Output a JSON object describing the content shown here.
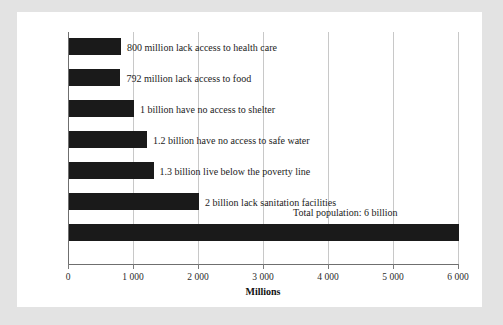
{
  "chart_data": {
    "type": "bar",
    "orientation": "horizontal",
    "title": "",
    "xlabel": "Millions",
    "ylabel": "",
    "xlim": [
      0,
      6000
    ],
    "grid": true,
    "legend": false,
    "xticks": [
      "0",
      "1 000",
      "2 000",
      "3 000",
      "4 000",
      "5 000",
      "6 000"
    ],
    "xtick_values": [
      0,
      1000,
      2000,
      3000,
      4000,
      5000,
      6000
    ],
    "categories": [
      "800 million lack access to health care",
      "792 million lack access to food",
      "1 billion have no access to shelter",
      "1.2 billion have no access to safe water",
      "1.3 billion live below the poverty line",
      "2 billion lack sanitation facilities",
      "Total population: 6 billion"
    ],
    "values": [
      800,
      792,
      1000,
      1200,
      1300,
      2000,
      6000
    ],
    "bar_color": "#1a1a1a",
    "annotations": [
      {
        "text": "Total population: 6 billion",
        "value": 6000
      }
    ],
    "bars": [
      {
        "label": "800 million lack access to health care",
        "value": 800
      },
      {
        "label": "792 million lack access to food",
        "value": 792
      },
      {
        "label": "1 billion have no access to shelter",
        "value": 1000
      },
      {
        "label": "1.2 billion have no access to safe water",
        "value": 1200
      },
      {
        "label": "1.3 billion live below the poverty line",
        "value": 1300
      },
      {
        "label": "2 billion lack sanitation facilities",
        "value": 2000
      },
      {
        "label": "",
        "value": 6000
      }
    ]
  },
  "colors": {
    "background": "#e3e3e3",
    "card": "#ffffff",
    "bar": "#1a1a1a",
    "gridline": "#c8c8c8",
    "axis": "#6f6f6f",
    "text": "#1c1c1c"
  }
}
